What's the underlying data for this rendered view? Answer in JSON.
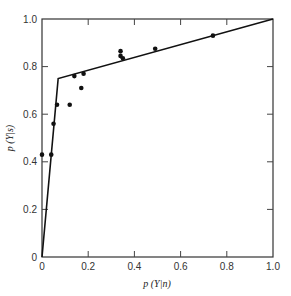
{
  "chart_data": {
    "type": "scatter",
    "title": "",
    "xlabel": "p (Y|n)",
    "ylabel": "p (Y|s)",
    "xlim": [
      0,
      1.0
    ],
    "ylim": [
      0,
      1.0
    ],
    "grid": false,
    "legend": null,
    "x_ticks": [
      0,
      0.2,
      0.4,
      0.6,
      0.8,
      1.0
    ],
    "x_tick_labels": [
      "0",
      "0.2",
      "0.4",
      "0.6",
      "0.8",
      "1.0"
    ],
    "y_ticks": [
      0,
      0.2,
      0.4,
      0.6,
      0.8,
      1.0
    ],
    "y_tick_labels": [
      "0",
      "0.2",
      "0.4",
      "0.6",
      "0.8",
      "1.0"
    ],
    "series": [
      {
        "name": "observed",
        "kind": "scatter",
        "x": [
          0.0,
          0.04,
          0.05,
          0.065,
          0.12,
          0.14,
          0.17,
          0.18,
          0.34,
          0.34,
          0.35,
          0.49,
          0.74
        ],
        "y": [
          0.43,
          0.43,
          0.56,
          0.64,
          0.64,
          0.76,
          0.71,
          0.77,
          0.865,
          0.845,
          0.835,
          0.875,
          0.93
        ]
      },
      {
        "name": "fitted",
        "kind": "line",
        "x": [
          0.0,
          0.07,
          1.0
        ],
        "y": [
          0.0,
          0.75,
          1.0
        ]
      }
    ]
  }
}
